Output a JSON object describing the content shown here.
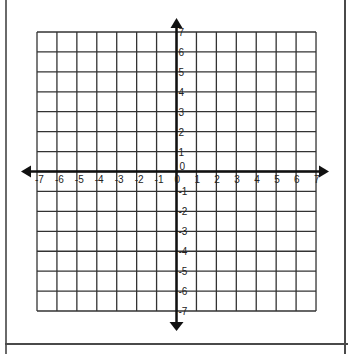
{
  "chart_data": {
    "type": "coordinate-plane",
    "title": "",
    "x_axis": {
      "min": -7,
      "max": 7,
      "step": 1,
      "tick_labels": [
        "-7",
        "-6",
        "-5",
        "-4",
        "-3",
        "-2",
        "-1",
        "0",
        "1",
        "2",
        "3",
        "4",
        "5",
        "6",
        "7"
      ]
    },
    "y_axis": {
      "min": -7,
      "max": 7,
      "step": 1,
      "tick_labels": [
        "7",
        "6",
        "5",
        "4",
        "3",
        "2",
        "1",
        "0",
        "-1",
        "-2",
        "-3",
        "-4",
        "-5",
        "-6",
        "-7"
      ]
    },
    "grid": true,
    "arrows": [
      "left",
      "right",
      "up",
      "down"
    ],
    "series": []
  },
  "colors": {
    "grid": "#333333",
    "axis": "#111111",
    "frame": "#4a4a4a"
  }
}
